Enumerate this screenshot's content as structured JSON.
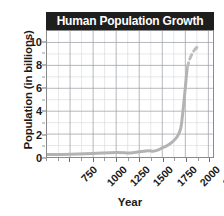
{
  "chart_data": {
    "type": "line",
    "title": "Human Population Growth",
    "xlabel": "Year",
    "ylabel": "Population (in billions)",
    "xlim": [
      500,
      2300
    ],
    "ylim": [
      0,
      11
    ],
    "grid": true,
    "legend": false,
    "xticks": [
      750,
      1000,
      1250,
      1500,
      1750,
      2000,
      2250
    ],
    "xtick_labels": [
      "750",
      "1000",
      "1250",
      "1500",
      "1750",
      "2000",
      "2250"
    ],
    "xtick_minor_step": 125,
    "yticks": [
      0,
      2,
      4,
      6,
      8,
      10
    ],
    "ytick_labels": [
      "0",
      "2",
      "4",
      "6",
      "8",
      "10"
    ],
    "ytick_minor": [
      1,
      3,
      5,
      7,
      9
    ],
    "series": [
      {
        "name": "Observed population",
        "style": "solid",
        "color": "#b3b3b3",
        "x": [
          500,
          750,
          1000,
          1250,
          1400,
          1500,
          1600,
          1650,
          1700,
          1750,
          1800,
          1850,
          1900,
          1927,
          1950,
          1960,
          1974,
          1987,
          1999,
          2011,
          2020
        ],
        "y": [
          0.21,
          0.24,
          0.31,
          0.4,
          0.35,
          0.46,
          0.55,
          0.5,
          0.6,
          0.79,
          0.98,
          1.26,
          1.65,
          2.0,
          2.5,
          3.0,
          4.0,
          5.0,
          6.0,
          7.0,
          7.8
        ]
      },
      {
        "name": "Projected population",
        "style": "dashed",
        "color": "#bdbdbd",
        "x": [
          2020,
          2050,
          2080,
          2100,
          2130,
          2150
        ],
        "y": [
          7.8,
          8.6,
          9.1,
          9.35,
          9.6,
          9.7
        ]
      }
    ]
  },
  "chart": {
    "title": "Human Population Growth",
    "ylabel": "Population (in billions)",
    "xlabel": "Year",
    "title_bg": "#1e1e1e",
    "title_fg": "#ffffff",
    "curve_color": "#b3b3b3",
    "grid_major_color": "#9fa3a8",
    "grid_minor_color": "#d9dcdf",
    "axis_color": "#8a8a8a"
  }
}
